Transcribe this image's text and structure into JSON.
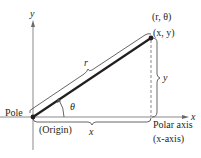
{
  "diagram": {
    "labels": {
      "y_axis": "y",
      "x_axis": "x",
      "polar_point": "(r, θ)",
      "rect_point": "(x, y)",
      "radius": "r",
      "angle": "θ",
      "vertical_leg": "y",
      "horizontal_leg": "x",
      "pole": "Pole",
      "origin": "(Origin)",
      "polar_axis": "Polar axis",
      "polar_axis_note": "(x-axis)"
    },
    "colors": {
      "ink": "#231f20",
      "axis": "#7a7a7a",
      "dashed": "#8a8a8a"
    }
  }
}
